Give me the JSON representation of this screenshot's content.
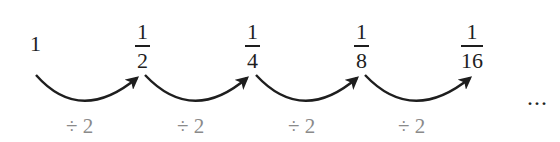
{
  "sequence": {
    "terms": [
      {
        "type": "integer",
        "value": "1"
      },
      {
        "type": "fraction",
        "numerator": "1",
        "denominator": "2"
      },
      {
        "type": "fraction",
        "numerator": "1",
        "denominator": "4"
      },
      {
        "type": "fraction",
        "numerator": "1",
        "denominator": "8"
      },
      {
        "type": "fraction",
        "numerator": "1",
        "denominator": "16"
      }
    ],
    "operations": [
      "÷ 2",
      "÷ 2",
      "÷ 2",
      "÷ 2"
    ],
    "continuation": "...",
    "colors": {
      "text": "#1e1e1e",
      "operation": "#8a8a8a",
      "arrow": "#1e1e1e"
    }
  }
}
